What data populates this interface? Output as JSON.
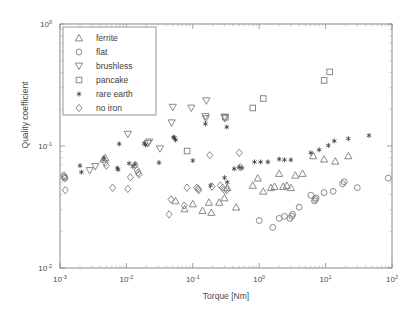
{
  "chart_data": {
    "type": "scatter",
    "title": "",
    "xlabel": "Torque [Nm]",
    "ylabel": "Quality coefficient",
    "xscale": "log",
    "yscale": "log",
    "xlim": [
      0.001,
      100
    ],
    "ylim": [
      0.01,
      1
    ],
    "xticks": [
      0.001,
      0.01,
      0.1,
      1,
      10,
      100
    ],
    "xticklabels": [
      "10-3",
      "10-2",
      "10-1",
      "100",
      "101",
      "102"
    ],
    "yticks": [
      0.01,
      0.1,
      1
    ],
    "yticklabels": [
      "10-2",
      "10-1",
      "100"
    ],
    "grid": false,
    "legend_position": "upper left",
    "series": [
      {
        "name": "ferrite",
        "marker": "triangle-up",
        "points": [
          [
            0.0045,
            0.078
          ],
          [
            0.0048,
            0.08
          ],
          [
            0.055,
            0.0355
          ],
          [
            0.075,
            0.0305
          ],
          [
            0.1,
            0.0335
          ],
          [
            0.14,
            0.0295
          ],
          [
            0.175,
            0.0345
          ],
          [
            0.19,
            0.0285
          ],
          [
            0.25,
            0.0345
          ],
          [
            0.3,
            0.0375
          ],
          [
            0.33,
            0.0455
          ],
          [
            0.45,
            0.0315
          ],
          [
            0.8,
            0.0475
          ],
          [
            0.95,
            0.0545
          ],
          [
            1.15,
            0.0425
          ],
          [
            1.5,
            0.0455
          ],
          [
            1.7,
            0.0465
          ],
          [
            2.0,
            0.0595
          ],
          [
            2.3,
            0.0465
          ],
          [
            2.6,
            0.0475
          ],
          [
            3.0,
            0.0455
          ],
          [
            3.5,
            0.0575
          ],
          [
            4.5,
            0.0595
          ],
          [
            6.5,
            0.083
          ],
          [
            9.5,
            0.078
          ],
          [
            14.0,
            0.075
          ],
          [
            22.0,
            0.083
          ]
        ]
      },
      {
        "name": "flat",
        "marker": "circle",
        "points": [
          [
            0.00115,
            0.056
          ],
          [
            0.00118,
            0.0545
          ],
          [
            1.0,
            0.0245
          ],
          [
            1.6,
            0.0215
          ],
          [
            2.0,
            0.0255
          ],
          [
            2.4,
            0.0265
          ],
          [
            2.9,
            0.0255
          ],
          [
            3.1,
            0.0265
          ],
          [
            3.2,
            0.0275
          ],
          [
            4.0,
            0.0315
          ],
          [
            6.0,
            0.0395
          ],
          [
            6.8,
            0.0355
          ],
          [
            7.0,
            0.0365
          ],
          [
            7.2,
            0.0375
          ],
          [
            9.5,
            0.0415
          ],
          [
            13.0,
            0.0425
          ],
          [
            18.0,
            0.049
          ],
          [
            19.0,
            0.051
          ],
          [
            30.0,
            0.0455
          ],
          [
            88.0,
            0.0545
          ]
        ]
      },
      {
        "name": "brushless",
        "marker": "triangle-down",
        "points": [
          [
            0.0028,
            0.063
          ],
          [
            0.0034,
            0.068
          ],
          [
            0.0105,
            0.125
          ],
          [
            0.021,
            0.105
          ],
          [
            0.022,
            0.108
          ],
          [
            0.032,
            0.095
          ],
          [
            0.048,
            0.155
          ],
          [
            0.05,
            0.208
          ],
          [
            0.095,
            0.205
          ],
          [
            0.16,
            0.235
          ],
          [
            0.155,
            0.175
          ],
          [
            0.157,
            0.168
          ],
          [
            0.3,
            0.173
          ],
          [
            0.305,
            0.168
          ]
        ]
      },
      {
        "name": "pancake",
        "marker": "square",
        "points": [
          [
            0.082,
            0.091
          ],
          [
            0.31,
            0.172
          ],
          [
            0.8,
            0.205
          ],
          [
            1.15,
            0.245
          ],
          [
            9.5,
            0.345
          ],
          [
            11.5,
            0.405
          ]
        ]
      },
      {
        "name": "rare earth",
        "marker": "star",
        "points": [
          [
            0.002,
            0.069
          ],
          [
            0.0021,
            0.061
          ],
          [
            0.0046,
            0.079
          ],
          [
            0.0073,
            0.066
          ],
          [
            0.0075,
            0.064
          ],
          [
            0.0078,
            0.104
          ],
          [
            0.011,
            0.072
          ],
          [
            0.0125,
            0.068
          ],
          [
            0.0135,
            0.071
          ],
          [
            0.0185,
            0.105
          ],
          [
            0.0195,
            0.102
          ],
          [
            0.031,
            0.073
          ],
          [
            0.051,
            0.118
          ],
          [
            0.053,
            0.117
          ],
          [
            0.055,
            0.112
          ],
          [
            0.1,
            0.076
          ],
          [
            0.155,
            0.152
          ],
          [
            0.185,
            0.0475
          ],
          [
            0.3,
            0.055
          ],
          [
            0.325,
            0.143
          ],
          [
            0.33,
            0.0505
          ],
          [
            0.42,
            0.065
          ],
          [
            0.5,
            0.067
          ],
          [
            0.55,
            0.066
          ],
          [
            0.85,
            0.074
          ],
          [
            1.05,
            0.074
          ],
          [
            1.35,
            0.074
          ],
          [
            2.0,
            0.078
          ],
          [
            2.4,
            0.077
          ],
          [
            3.0,
            0.077
          ],
          [
            6.0,
            0.088
          ],
          [
            8.0,
            0.093
          ],
          [
            11.0,
            0.101
          ],
          [
            13.5,
            0.11
          ],
          [
            22.0,
            0.115
          ],
          [
            45.0,
            0.122
          ]
        ]
      },
      {
        "name": "no iron",
        "marker": "diamond",
        "points": [
          [
            0.00115,
            0.0575
          ],
          [
            0.00118,
            0.0545
          ],
          [
            0.0012,
            0.0435
          ],
          [
            0.0048,
            0.073
          ],
          [
            0.005,
            0.069
          ],
          [
            0.0062,
            0.0455
          ],
          [
            0.0105,
            0.0445
          ],
          [
            0.0115,
            0.0555
          ],
          [
            0.0135,
            0.07
          ],
          [
            0.0145,
            0.0635
          ],
          [
            0.015,
            0.0605
          ],
          [
            0.0155,
            0.0585
          ],
          [
            0.044,
            0.0275
          ],
          [
            0.047,
            0.0365
          ],
          [
            0.074,
            0.0325
          ],
          [
            0.082,
            0.0455
          ],
          [
            0.115,
            0.0455
          ],
          [
            0.12,
            0.0445
          ],
          [
            0.123,
            0.0435
          ],
          [
            0.18,
            0.084
          ],
          [
            0.195,
            0.0465
          ],
          [
            0.26,
            0.0475
          ],
          [
            0.28,
            0.0455
          ],
          [
            0.3,
            0.0435
          ],
          [
            0.325,
            0.0435
          ],
          [
            0.5,
            0.088
          ],
          [
            0.52,
            0.067
          ]
        ]
      }
    ]
  },
  "legend": {
    "items": [
      {
        "label": "ferrite",
        "marker": "triangle-up"
      },
      {
        "label": "flat",
        "marker": "circle"
      },
      {
        "label": "brushless",
        "marker": "triangle-down"
      },
      {
        "label": "pancake",
        "marker": "square"
      },
      {
        "label": "rare earth",
        "marker": "star"
      },
      {
        "label": "no iron",
        "marker": "diamond"
      }
    ]
  },
  "colors": {
    "axis": "#8a8a8a",
    "marker": "#7d7d7d",
    "star": "#3a3a3a",
    "text": "#4a4a4a",
    "background": "#ffffff"
  }
}
